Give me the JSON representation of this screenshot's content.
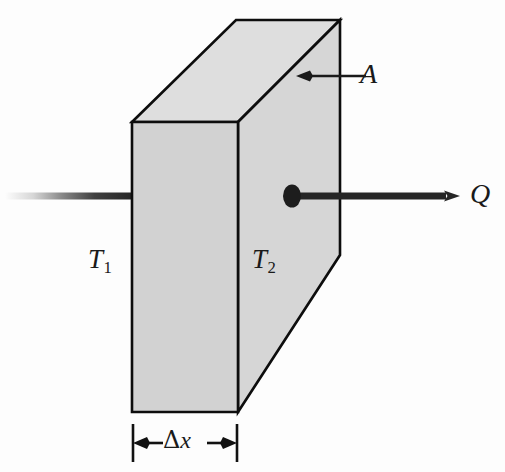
{
  "figure": {
    "labels": {
      "temperature_hot": "T",
      "temperature_hot_sub": "1",
      "temperature_cold": "T",
      "temperature_cold_sub": "2",
      "heat_flow": "Q",
      "area": "A",
      "thickness_delta": "Δ",
      "thickness_var": "x"
    },
    "colors": {
      "front_face": "#d2d2d2",
      "top_face": "#dedede",
      "right_face": "#d6d6d6",
      "outline": "#0d0d0d",
      "arrow": "#262626",
      "text": "#1a1a1a",
      "background": "#fdfdfd"
    },
    "geometry": {
      "front_face": [
        [
          132,
          122
        ],
        [
          238,
          122
        ],
        [
          238,
          412
        ],
        [
          132,
          412
        ]
      ],
      "top_face": [
        [
          132,
          122
        ],
        [
          236,
          20
        ],
        [
          340,
          20
        ],
        [
          238,
          122
        ]
      ],
      "right_face": [
        [
          238,
          122
        ],
        [
          340,
          20
        ],
        [
          340,
          255
        ],
        [
          238,
          412
        ]
      ],
      "inlet_line": {
        "x1": 5,
        "x2": 132,
        "y": 196
      },
      "outlet_arrow": {
        "x1": 292,
        "x2": 458,
        "y": 196
      },
      "outlet_dot": {
        "cx": 292,
        "cy": 196,
        "rx": 9,
        "ry": 11
      },
      "area_arrow": {
        "x1": 366,
        "x2": 299,
        "y": 76
      },
      "dimension_line": {
        "y": 443,
        "x1": 132,
        "x2": 238
      }
    }
  }
}
